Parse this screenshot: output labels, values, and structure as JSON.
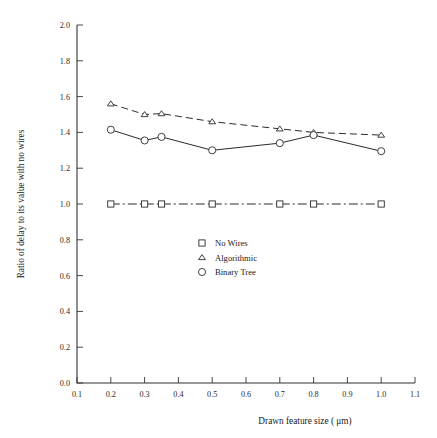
{
  "chart_data": {
    "type": "line",
    "title": "",
    "xlabel": "Drawn feature size ( μm)",
    "ylabel": "Ratio of delay to its value with no wires",
    "xlim": [
      0.1,
      1.1
    ],
    "ylim": [
      0.0,
      2.0
    ],
    "grid": false,
    "legend_position": "center",
    "x": [
      0.2,
      0.3,
      0.35,
      0.5,
      0.7,
      0.8,
      1.0
    ],
    "xticks": [
      "0.1",
      "0.2",
      "0.3",
      "0.4",
      "0.5",
      "0.6",
      "0.7",
      "0.8",
      "0.9",
      "1.0",
      "1.1"
    ],
    "xtick_values": [
      0.1,
      0.2,
      0.3,
      0.4,
      0.5,
      0.6,
      0.7,
      0.8,
      0.9,
      1.0,
      1.1
    ],
    "yticks": [
      "0.0",
      "0.2",
      "0.4",
      "0.6",
      "0.8",
      "1.0",
      "1.2",
      "1.4",
      "1.6",
      "1.8",
      "2.0"
    ],
    "ytick_values": [
      0.0,
      0.2,
      0.4,
      0.6,
      0.8,
      1.0,
      1.2,
      1.4,
      1.6,
      1.8,
      2.0
    ],
    "series": [
      {
        "name": "No Wires",
        "marker": "square",
        "linestyle": "dashdot",
        "color": "#2b2b2b",
        "values": [
          1.0,
          1.0,
          1.0,
          1.0,
          1.0,
          1.0,
          1.0
        ]
      },
      {
        "name": "Algorithmic",
        "marker": "triangle",
        "linestyle": "dashed",
        "color": "#2b2b2b",
        "values": [
          1.56,
          1.5,
          1.505,
          1.46,
          1.42,
          1.4,
          1.385
        ]
      },
      {
        "name": "Binary Tree",
        "marker": "circle",
        "linestyle": "solid",
        "color": "#2b2b2b",
        "values": [
          1.415,
          1.355,
          1.375,
          1.3,
          1.34,
          1.385,
          1.295
        ]
      }
    ]
  },
  "legend": {
    "entries": [
      {
        "label": "No Wires",
        "marker": "square"
      },
      {
        "label": "Algorithmic",
        "marker": "triangle"
      },
      {
        "label": "Binary Tree",
        "marker": "circle"
      }
    ]
  },
  "axes": {
    "x_title": "Drawn feature size ( μm)",
    "y_title": "Ratio of delay to its value with no wires"
  }
}
